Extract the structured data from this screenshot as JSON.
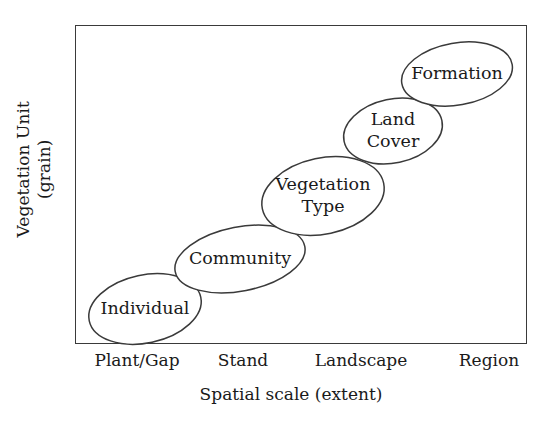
{
  "figure": {
    "background_color": "#ffffff",
    "line_color": "#3a3a3a",
    "text_color": "#1a1a1a"
  },
  "axes": {
    "y_title_line1": "Vegetation Unit",
    "y_title_line2": "(grain)",
    "x_title": "Spatial scale (extent)",
    "x_ticks": [
      {
        "label": "Plant/Gap",
        "center_x": 137
      },
      {
        "label": "Stand",
        "center_x": 243
      },
      {
        "label": "Landscape",
        "center_x": 361
      },
      {
        "label": "Region",
        "center_x": 489
      }
    ]
  },
  "chart_data": {
    "type": "scatter",
    "title": "",
    "xlabel": "Spatial scale (extent)",
    "ylabel": "Vegetation Unit (grain)",
    "grid": false,
    "legend": "none",
    "x_tick_labels": [
      "Plant/Gap",
      "Stand",
      "Landscape",
      "Region"
    ],
    "y_tick_labels": [],
    "xlim": [
      0,
      4
    ],
    "ylim": [
      0,
      5
    ],
    "note": "Five labelled ellipses arranged along a rising diagonal, showing that coarser vegetation units correspond to broader spatial scales.",
    "categories": [
      "Individual",
      "Community",
      "Vegetation Type",
      "Land Cover",
      "Formation"
    ],
    "values": [
      1,
      2,
      3,
      4,
      5
    ],
    "x": [
      0.55,
      1.45,
      2.3,
      2.95,
      3.55
    ],
    "points": [
      {
        "label": "Individual",
        "lines": [
          "Individual"
        ],
        "cx": 145,
        "cy": 309,
        "rx": 57,
        "ry": 34,
        "rotation": -12,
        "spatial_scale": "Plant/Gap",
        "rank": 1
      },
      {
        "label": "Community",
        "lines": [
          "Community"
        ],
        "cx": 240,
        "cy": 259,
        "rx": 66,
        "ry": 32,
        "rotation": -11,
        "spatial_scale": "Stand",
        "rank": 2
      },
      {
        "label": "Vegetation Type",
        "lines": [
          "Vegetation",
          "Type"
        ],
        "cx": 323,
        "cy": 196,
        "rx": 62,
        "ry": 38,
        "rotation": -12,
        "spatial_scale": "Landscape",
        "rank": 3
      },
      {
        "label": "Land Cover",
        "lines": [
          "Land",
          "Cover"
        ],
        "cx": 393,
        "cy": 131,
        "rx": 50,
        "ry": 32,
        "rotation": -12,
        "spatial_scale": "Landscape",
        "rank": 4
      },
      {
        "label": "Formation",
        "lines": [
          "Formation"
        ],
        "cx": 457,
        "cy": 74,
        "rx": 56,
        "ry": 31,
        "rotation": -10,
        "spatial_scale": "Region",
        "rank": 5
      }
    ]
  }
}
